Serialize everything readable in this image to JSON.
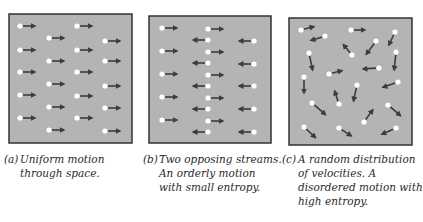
{
  "colors": {
    "box_fill": "#b4b4b4",
    "box_border": "#333333",
    "arrow": "#3c3c3c",
    "dot": "#ffffff"
  },
  "panels": [
    {
      "id": "a",
      "box": {
        "x": 9,
        "y": 14,
        "w": 123,
        "h": 129
      },
      "caption": {
        "label": "(a)",
        "lines": [
          "Uniform motion",
          "through space."
        ],
        "x": 4,
        "y": 152
      },
      "particles": [
        {
          "x": 20,
          "y": 26,
          "tx": 37,
          "ty": 26
        },
        {
          "x": 20,
          "y": 50,
          "tx": 37,
          "ty": 50
        },
        {
          "x": 20,
          "y": 72,
          "tx": 37,
          "ty": 72
        },
        {
          "x": 20,
          "y": 95,
          "tx": 37,
          "ty": 95
        },
        {
          "x": 20,
          "y": 118,
          "tx": 37,
          "ty": 118
        },
        {
          "x": 49,
          "y": 38,
          "tx": 66,
          "ty": 38
        },
        {
          "x": 49,
          "y": 61,
          "tx": 66,
          "ty": 61
        },
        {
          "x": 49,
          "y": 84,
          "tx": 66,
          "ty": 84
        },
        {
          "x": 49,
          "y": 107,
          "tx": 66,
          "ty": 107
        },
        {
          "x": 49,
          "y": 130,
          "tx": 66,
          "ty": 130
        },
        {
          "x": 77,
          "y": 26,
          "tx": 94,
          "ty": 26
        },
        {
          "x": 77,
          "y": 50,
          "tx": 94,
          "ty": 50
        },
        {
          "x": 77,
          "y": 72,
          "tx": 94,
          "ty": 72
        },
        {
          "x": 77,
          "y": 96,
          "tx": 94,
          "ty": 96
        },
        {
          "x": 77,
          "y": 118,
          "tx": 94,
          "ty": 118
        },
        {
          "x": 105,
          "y": 41,
          "tx": 122,
          "ty": 41
        },
        {
          "x": 105,
          "y": 61,
          "tx": 122,
          "ty": 61
        },
        {
          "x": 105,
          "y": 86,
          "tx": 122,
          "ty": 86
        },
        {
          "x": 105,
          "y": 108,
          "tx": 122,
          "ty": 108
        },
        {
          "x": 105,
          "y": 131,
          "tx": 122,
          "ty": 131
        }
      ]
    },
    {
      "id": "b",
      "box": {
        "x": 149,
        "y": 16,
        "w": 122,
        "h": 127
      },
      "caption": {
        "label": "(b)",
        "lines": [
          "Two opposing streams.",
          "An orderly motion",
          "with small entropy."
        ],
        "x": 143,
        "y": 152
      },
      "particles": [
        {
          "x": 162,
          "y": 28,
          "tx": 179,
          "ty": 28
        },
        {
          "x": 162,
          "y": 51,
          "tx": 179,
          "ty": 51
        },
        {
          "x": 162,
          "y": 74,
          "tx": 179,
          "ty": 74
        },
        {
          "x": 162,
          "y": 97,
          "tx": 179,
          "ty": 97
        },
        {
          "x": 162,
          "y": 120,
          "tx": 179,
          "ty": 120
        },
        {
          "x": 208,
          "y": 40,
          "tx": 191,
          "ty": 40
        },
        {
          "x": 208,
          "y": 63,
          "tx": 191,
          "ty": 63
        },
        {
          "x": 208,
          "y": 86,
          "tx": 191,
          "ty": 86
        },
        {
          "x": 208,
          "y": 109,
          "tx": 191,
          "ty": 109
        },
        {
          "x": 208,
          "y": 132,
          "tx": 191,
          "ty": 132
        },
        {
          "x": 208,
          "y": 29,
          "tx": 225,
          "ty": 29
        },
        {
          "x": 208,
          "y": 52,
          "tx": 225,
          "ty": 52
        },
        {
          "x": 208,
          "y": 75,
          "tx": 225,
          "ty": 75
        },
        {
          "x": 208,
          "y": 98,
          "tx": 225,
          "ty": 98
        },
        {
          "x": 208,
          "y": 121,
          "tx": 225,
          "ty": 121
        },
        {
          "x": 254,
          "y": 41,
          "tx": 237,
          "ty": 41
        },
        {
          "x": 254,
          "y": 64,
          "tx": 237,
          "ty": 64
        },
        {
          "x": 254,
          "y": 86,
          "tx": 237,
          "ty": 86
        },
        {
          "x": 254,
          "y": 109,
          "tx": 237,
          "ty": 109
        },
        {
          "x": 254,
          "y": 132,
          "tx": 237,
          "ty": 132
        }
      ]
    },
    {
      "id": "c",
      "box": {
        "x": 289,
        "y": 18,
        "w": 123,
        "h": 127
      },
      "caption": {
        "label": "(c)",
        "lines": [
          "A random distribution",
          "of velocities. A",
          "disordered motion with",
          "high entropy."
        ],
        "x": 282,
        "y": 152
      },
      "particles": [
        {
          "x": 301,
          "y": 30,
          "tx": 316,
          "ty": 26
        },
        {
          "x": 325,
          "y": 36,
          "tx": 309,
          "ty": 41
        },
        {
          "x": 351,
          "y": 30,
          "tx": 367,
          "ty": 30
        },
        {
          "x": 395,
          "y": 32,
          "tx": 388,
          "ty": 47
        },
        {
          "x": 376,
          "y": 41,
          "tx": 365,
          "ty": 56
        },
        {
          "x": 352,
          "y": 55,
          "tx": 342,
          "ty": 43
        },
        {
          "x": 309,
          "y": 53,
          "tx": 313,
          "ty": 72
        },
        {
          "x": 396,
          "y": 52,
          "tx": 394,
          "ty": 72
        },
        {
          "x": 379,
          "y": 68,
          "tx": 361,
          "ty": 69
        },
        {
          "x": 329,
          "y": 74,
          "tx": 344,
          "ty": 70
        },
        {
          "x": 304,
          "y": 77,
          "tx": 304,
          "ty": 95
        },
        {
          "x": 398,
          "y": 82,
          "tx": 381,
          "ty": 88
        },
        {
          "x": 357,
          "y": 85,
          "tx": 353,
          "ty": 103
        },
        {
          "x": 339,
          "y": 104,
          "tx": 334,
          "ty": 89
        },
        {
          "x": 312,
          "y": 103,
          "tx": 327,
          "ty": 116
        },
        {
          "x": 388,
          "y": 105,
          "tx": 402,
          "ty": 117
        },
        {
          "x": 364,
          "y": 122,
          "tx": 374,
          "ty": 108
        },
        {
          "x": 304,
          "y": 127,
          "tx": 317,
          "ty": 139
        },
        {
          "x": 339,
          "y": 128,
          "tx": 353,
          "ty": 137
        },
        {
          "x": 396,
          "y": 128,
          "tx": 380,
          "ty": 135
        }
      ]
    }
  ]
}
